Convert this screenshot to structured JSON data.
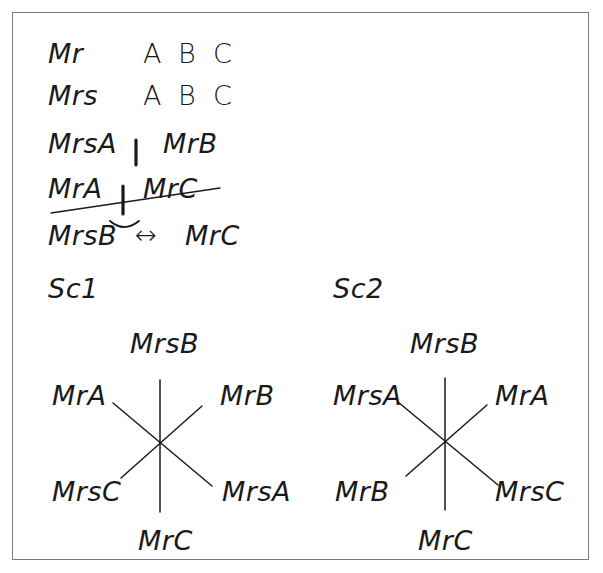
{
  "notes": {
    "rows": [
      {
        "label": "Mr",
        "letters": [
          "A",
          "B",
          "C"
        ]
      },
      {
        "label": "Mrs",
        "letters": [
          "A",
          "B",
          "C"
        ]
      }
    ],
    "pair_line": {
      "left": "MrsA",
      "separator": "|",
      "right": "MrB"
    },
    "struck_line": {
      "left": "MrA",
      "separator": "|",
      "right": "MrC",
      "struck_through": true
    },
    "relation_line": {
      "left": "MrsB",
      "arrow": "↔",
      "right": "MrC"
    }
  },
  "scenarios": [
    {
      "title": "Sc1",
      "top": "MrsB",
      "upper_left": "MrA",
      "upper_right": "MrB",
      "lower_left": "MrsC",
      "lower_right": "MrsA",
      "bottom": "MrC"
    },
    {
      "title": "Sc2",
      "top": "MrsB",
      "upper_left": "MrsA",
      "upper_right": "MrA",
      "lower_left": "MrB",
      "lower_right": "MrsC",
      "bottom": "MrC"
    }
  ],
  "colors": {
    "ink": "#1a1a1a",
    "frame": "#7a7a7a",
    "background": "#ffffff"
  }
}
